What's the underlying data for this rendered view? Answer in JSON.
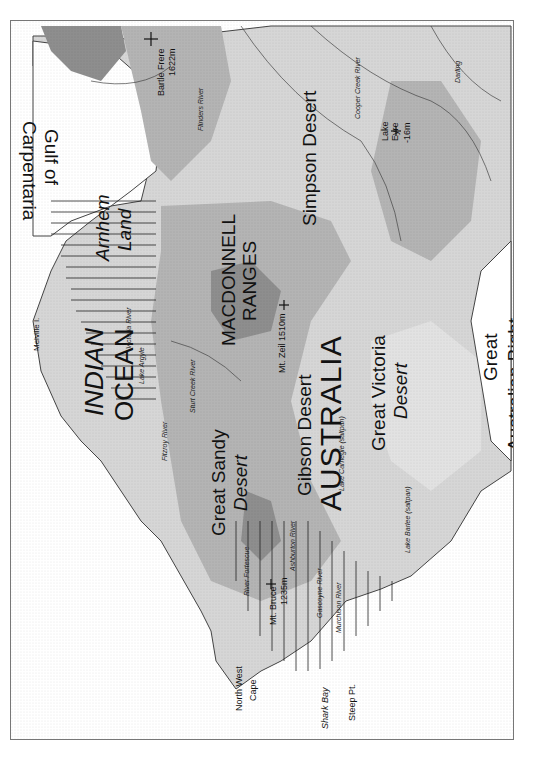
{
  "map": {
    "title": "Australia relief map",
    "orientation": "rotated 90° counter-clockwise (north at left)",
    "colors": {
      "ocean": "#ffffff",
      "lowland": "#d6d6d6",
      "midland": "#b4b4b4",
      "upland": "#8e8e8e",
      "highland": "#6e6e6e",
      "coast": "#444444",
      "hatch": "#222222"
    },
    "water_bodies": {
      "indian_ocean_1": "INDIAN",
      "indian_ocean_2": "OCEAN",
      "gulf_1": "Gulf of",
      "gulf_2": "Carpentaria",
      "bight_1": "Great",
      "bight_2": "Australian Bight"
    },
    "regions": {
      "country": "AUSTRALIA",
      "arnhem_1": "Arnhem",
      "arnhem_2": "Land",
      "macdonnell_1": "MACDONNELL",
      "macdonnell_2": "RANGES",
      "simpson": "Simpson Desert",
      "great_sandy_1": "Great Sandy",
      "great_sandy_2": "Desert",
      "gibson": "Gibson Desert",
      "great_victoria_1": "Great Victoria",
      "great_victoria_2": "Desert"
    },
    "peaks": {
      "bartle_frere_1": "Bartle Frere",
      "bartle_frere_2": "1622m",
      "mt_zeil": "Mt. Zeil 1510m",
      "mt_bruce_1": "Mt. Bruce",
      "mt_bruce_2": "1235m",
      "lake_eyre_1": "Lake",
      "lake_eyre_2": "Eyre",
      "lake_eyre_3": "-16m"
    },
    "rivers": {
      "flinders": "Flinders River",
      "cooper": "Cooper Creek River",
      "darling": "Darling",
      "murray": "Murray River",
      "victoria": "Victoria River",
      "sturt": "Sturt Creek River",
      "fitzroy": "Fitzroy River",
      "fortescue": "River Fortescue",
      "ashburton": "Ashburton River",
      "gascoyne": "Gascoyne River",
      "murchison": "Murchison River"
    },
    "lakes": {
      "argyle": "Lake Argyle",
      "carnegie": "Lake Carnegie (saltpan)",
      "barlee": "Lake Barlee (saltpan)",
      "other": "Dundas"
    },
    "places": {
      "melville": "Melville I.",
      "nw_cape_1": "North West",
      "nw_cape_2": "Cape",
      "shark_bay": "Shark Bay",
      "steep_pt": "Steep Pt."
    }
  }
}
